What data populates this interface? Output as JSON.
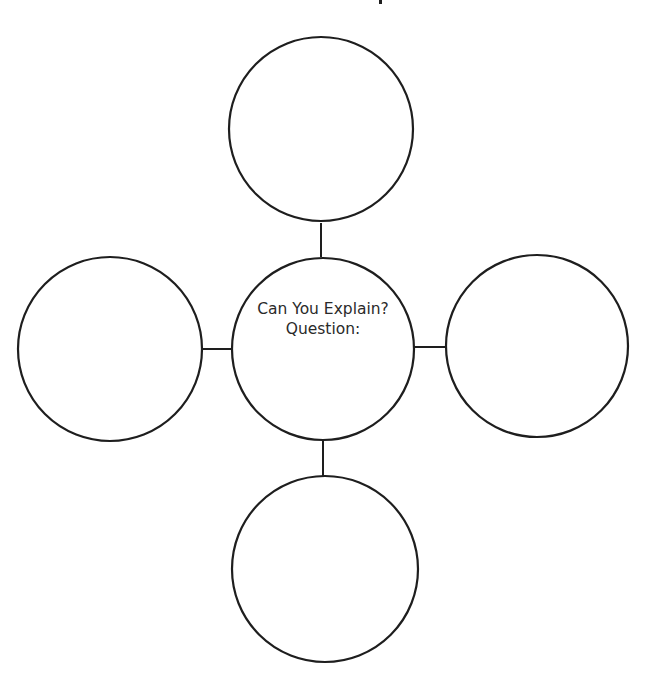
{
  "diagram": {
    "type": "concept-web",
    "title_fragment_visible": true,
    "center": {
      "line1": "Can You Explain?",
      "line2": "Question:"
    },
    "outer_nodes": [
      {
        "position": "top",
        "label": ""
      },
      {
        "position": "left",
        "label": ""
      },
      {
        "position": "right",
        "label": ""
      },
      {
        "position": "bottom",
        "label": ""
      }
    ],
    "colors": {
      "stroke": "#1e1e1e",
      "background": "#ffffff",
      "text": "#2a2a2a"
    }
  }
}
